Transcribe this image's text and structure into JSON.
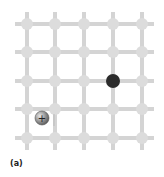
{
  "figure": {
    "caption": "(a)",
    "lattice": {
      "columns": 5,
      "rows": 5,
      "x_positions": [
        27,
        55,
        84,
        113,
        142
      ],
      "y_positions": [
        24,
        52,
        81,
        109,
        138
      ],
      "node_radius": 6,
      "bond_width": 4,
      "node_color": "#dcdcdc",
      "bond_color": "#d4d4d4"
    },
    "electron": {
      "label": "electron",
      "x": 113,
      "y": 81,
      "r": 7,
      "color": "#2b2b2b"
    },
    "hole": {
      "label": "+",
      "x": 42,
      "y": 118,
      "r": 7,
      "color": "#8a8a8a"
    }
  }
}
